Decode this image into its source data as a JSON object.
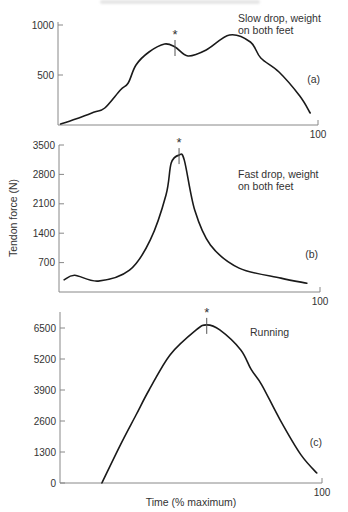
{
  "chart_data": [
    {
      "type": "line",
      "panel": "(a)",
      "title": "Slow drop, weight on both feet",
      "title_lines": [
        "Slow drop, weight",
        "on both feet"
      ],
      "xlabel": "",
      "ylabel": "Tendon force (N)",
      "xlim": [
        0,
        100
      ],
      "ylim": [
        0,
        1000
      ],
      "yticks": [
        500,
        1000
      ],
      "xtick_end_label": "100",
      "grid": false,
      "peak_marker": {
        "symbol": "*",
        "x": 45
      },
      "x": [
        1,
        8,
        14,
        18,
        24,
        27,
        30,
        35,
        41,
        45,
        50,
        57,
        66,
        74,
        78,
        85,
        93,
        97
      ],
      "values": [
        10,
        70,
        130,
        170,
        350,
        420,
        600,
        730,
        810,
        780,
        690,
        750,
        900,
        830,
        670,
        530,
        290,
        120
      ]
    },
    {
      "type": "line",
      "panel": "(b)",
      "title": "Fast drop, weight on both feet",
      "title_lines": [
        "Fast drop, weight",
        "on both feet"
      ],
      "xlabel": "",
      "ylabel": "Tendon force (N)",
      "xlim": [
        0,
        100
      ],
      "ylim": [
        0,
        3500
      ],
      "yticks": [
        700,
        1400,
        2100,
        2800,
        3500
      ],
      "xtick_end_label": "100",
      "grid": false,
      "peak_marker": {
        "symbol": "*",
        "x": 46
      },
      "x": [
        2,
        6,
        15,
        27,
        35,
        41,
        43,
        46,
        48,
        52,
        58,
        69,
        85,
        95
      ],
      "values": [
        290,
        400,
        260,
        520,
        1240,
        2310,
        3070,
        3260,
        3140,
        1950,
        1120,
        570,
        330,
        210
      ]
    },
    {
      "type": "line",
      "panel": "(c)",
      "title": "Running",
      "title_lines": [
        "Running"
      ],
      "xlabel": "Time (% maximum)",
      "ylabel": "Tendon force (N)",
      "xlim": [
        0,
        100
      ],
      "ylim": [
        0,
        6500
      ],
      "yticks": [
        0,
        1300,
        2600,
        3900,
        5200,
        6500
      ],
      "xtick_end_label": "100",
      "grid": false,
      "peak_marker": {
        "symbol": "*",
        "x": 56
      },
      "x": [
        16,
        23,
        29,
        34,
        42,
        52,
        56,
        61,
        69,
        73,
        77,
        84,
        92,
        98
      ],
      "values": [
        0,
        1590,
        2850,
        3900,
        5370,
        6420,
        6630,
        6420,
        5580,
        4750,
        4120,
        2650,
        1180,
        420
      ]
    }
  ],
  "labels": {
    "ylabel": "Tendon force (N)",
    "xlabel": "Time (% maximum)",
    "star": "*"
  },
  "colors": {
    "curve": "#1a1a1a",
    "axis": "#888888",
    "text": "#333333"
  }
}
